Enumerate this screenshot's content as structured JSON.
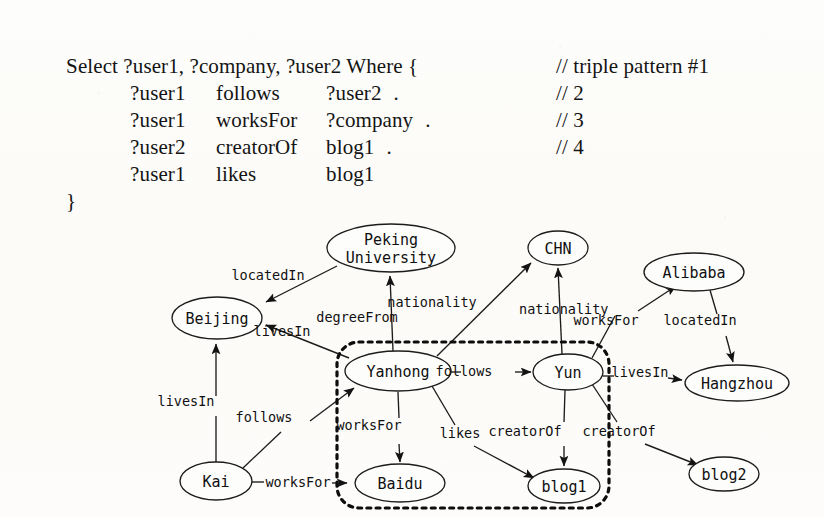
{
  "query": {
    "header": "Select ?user1, ?company, ?user2 Where {",
    "closing": "}",
    "triples": [
      {
        "subject": "?user1",
        "predicate": "follows",
        "object": "?user2",
        "terminator": ".",
        "comment": "// triple pattern #1"
      },
      {
        "subject": "?user1",
        "predicate": "worksFor",
        "object": "?company",
        "terminator": ".",
        "comment": "// 2"
      },
      {
        "subject": "?user2",
        "predicate": "creatorOf",
        "object": "blog1",
        "terminator": ".",
        "comment": "// 3"
      },
      {
        "subject": "?user1",
        "predicate": "likes",
        "object": "blog1",
        "terminator": "",
        "comment": "// 4"
      }
    ]
  },
  "graph": {
    "type": "rdf-graph",
    "nodes": [
      {
        "id": "peking",
        "label": "Peking University",
        "lines": [
          "Peking",
          "University"
        ],
        "cx": 391,
        "cy": 42,
        "rx": 64,
        "ry": 24
      },
      {
        "id": "chn",
        "label": "CHN",
        "lines": [
          "CHN"
        ],
        "cx": 558,
        "cy": 42,
        "rx": 30,
        "ry": 17
      },
      {
        "id": "alibaba",
        "label": "Alibaba",
        "lines": [
          "Alibaba"
        ],
        "cx": 694,
        "cy": 66,
        "rx": 50,
        "ry": 19
      },
      {
        "id": "beijing",
        "label": "Beijing",
        "lines": [
          "Beijing"
        ],
        "cx": 217,
        "cy": 112,
        "rx": 45,
        "ry": 21
      },
      {
        "id": "yanhong",
        "label": "Yanhong",
        "lines": [
          "Yanhong"
        ],
        "cx": 398,
        "cy": 165,
        "rx": 53,
        "ry": 20
      },
      {
        "id": "yun",
        "label": "Yun",
        "lines": [
          "Yun"
        ],
        "cx": 568,
        "cy": 166,
        "rx": 35,
        "ry": 18
      },
      {
        "id": "hangzhou",
        "label": "Hangzhou",
        "lines": [
          "Hangzhou"
        ],
        "cx": 737,
        "cy": 177,
        "rx": 52,
        "ry": 18
      },
      {
        "id": "blog2",
        "label": "blog2",
        "lines": [
          "blog2"
        ],
        "cx": 724,
        "cy": 268,
        "rx": 35,
        "ry": 17
      },
      {
        "id": "kai",
        "label": "Kai",
        "lines": [
          "Kai"
        ],
        "cx": 216,
        "cy": 275,
        "rx": 36,
        "ry": 19
      },
      {
        "id": "baidu",
        "label": "Baidu",
        "lines": [
          "Baidu"
        ],
        "cx": 400,
        "cy": 277,
        "rx": 45,
        "ry": 19
      },
      {
        "id": "blog1",
        "label": "blog1",
        "lines": [
          "blog1"
        ],
        "cx": 564,
        "cy": 280,
        "rx": 36,
        "ry": 17
      }
    ],
    "edges": [
      {
        "from": "peking",
        "to": "beijing",
        "label": "locatedIn",
        "label_x": 268,
        "label_y": 74
      },
      {
        "from": "yanhong",
        "to": "peking",
        "label": "degreeFrom",
        "label_x": 357,
        "label_y": 116
      },
      {
        "from": "yanhong",
        "to": "beijing",
        "label": "livesIn",
        "label_x": 282,
        "label_y": 130
      },
      {
        "from": "yanhong",
        "to": "chn",
        "label": "nationality",
        "label_x": 432,
        "label_y": 101
      },
      {
        "from": "yun",
        "to": "chn",
        "label": "nationality",
        "label_x": 519,
        "label_y": 108
      },
      {
        "from": "yanhong",
        "to": "yun",
        "label": "follows",
        "label_x": 464,
        "label_y": 170
      },
      {
        "from": "yanhong",
        "to": "baidu",
        "label": "worksFor",
        "label_x": 369,
        "label_y": 224
      },
      {
        "from": "yanhong",
        "to": "blog1",
        "label": "likes",
        "label_x": 460,
        "label_y": 232
      },
      {
        "from": "yun",
        "to": "blog1",
        "label": "creatorOf",
        "label_x": 525,
        "label_y": 230
      },
      {
        "from": "yun",
        "to": "blog2",
        "label": "creatorOf",
        "label_x": 619,
        "label_y": 230
      },
      {
        "from": "yun",
        "to": "alibaba",
        "label": "worksFor",
        "label_x": 606,
        "label_y": 119
      },
      {
        "from": "alibaba",
        "to": "hangzhou",
        "label": "locatedIn",
        "label_x": 679,
        "label_y": 119
      },
      {
        "from": "yun",
        "to": "hangzhou",
        "label": "livesIn",
        "label_x": 622,
        "label_y": 171
      },
      {
        "from": "kai",
        "to": "beijing",
        "label": "livesIn",
        "label_x": 186,
        "label_y": 200
      },
      {
        "from": "kai",
        "to": "yanhong",
        "label": "follows",
        "label_x": 264,
        "label_y": 216
      },
      {
        "from": "kai",
        "to": "baidu",
        "label": "worksFor",
        "label_x": 268,
        "label_y": 281
      }
    ],
    "selection": {
      "label": "matched-subgraph",
      "members": [
        "Yanhong",
        "Yun",
        "Baidu",
        "blog1"
      ],
      "x": 337,
      "y": 136,
      "width": 272,
      "height": 166,
      "radius": 22
    }
  }
}
